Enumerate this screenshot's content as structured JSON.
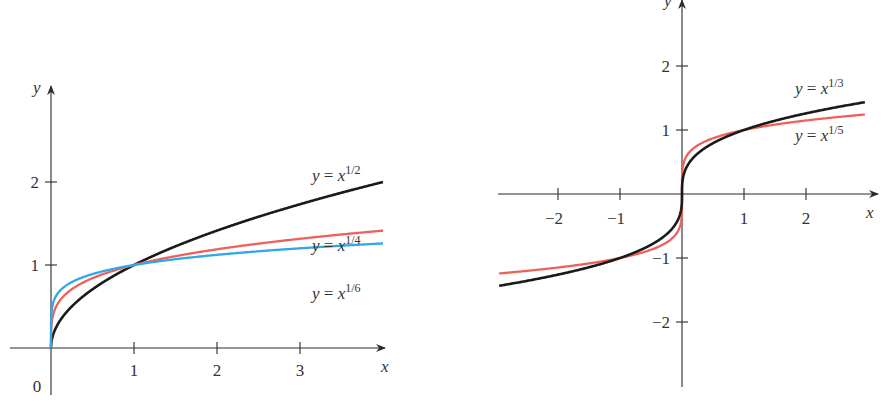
{
  "chart_data": [
    {
      "type": "line",
      "title": "",
      "xlabel": "x",
      "ylabel": "y",
      "xlim": [
        0,
        4
      ],
      "ylim": [
        0,
        2.6
      ],
      "origin_label": "0",
      "x_ticks": [
        "1",
        "2",
        "3"
      ],
      "y_ticks": [
        "1",
        "2"
      ],
      "grid": false,
      "series": [
        {
          "name": "y = x^(1/2)",
          "label_base": "y = x",
          "label_exp": "1/2",
          "exponent": 0.5,
          "color": "#1a1a1a",
          "x": [
            0,
            0.25,
            0.5,
            1,
            1.5,
            2,
            2.5,
            3,
            3.5,
            4
          ],
          "values": [
            0,
            0.5,
            0.71,
            1,
            1.22,
            1.41,
            1.58,
            1.73,
            1.87,
            2
          ]
        },
        {
          "name": "y = x^(1/4)",
          "label_base": "y = x",
          "label_exp": "1/4",
          "exponent": 0.25,
          "color": "#f0605a",
          "x": [
            0,
            0.25,
            0.5,
            1,
            1.5,
            2,
            2.5,
            3,
            3.5,
            4
          ],
          "values": [
            0,
            0.71,
            0.84,
            1,
            1.11,
            1.19,
            1.26,
            1.32,
            1.37,
            1.41
          ]
        },
        {
          "name": "y = x^(1/6)",
          "label_base": "y = x",
          "label_exp": "1/6",
          "exponent": 0.1667,
          "color": "#2fa8e8",
          "x": [
            0,
            0.25,
            0.5,
            1,
            1.5,
            2,
            2.5,
            3,
            3.5,
            4
          ],
          "values": [
            0,
            0.79,
            0.89,
            1,
            1.07,
            1.12,
            1.16,
            1.2,
            1.23,
            1.26
          ]
        }
      ]
    },
    {
      "type": "line",
      "title": "",
      "xlabel": "x",
      "ylabel": "y",
      "xlim": [
        -2.95,
        2.95
      ],
      "ylim": [
        -3,
        3
      ],
      "x_ticks": [
        "−2",
        "−1",
        "1",
        "2"
      ],
      "y_ticks": [
        "2",
        "1",
        "−1",
        "−2"
      ],
      "grid": false,
      "series": [
        {
          "name": "y = x^(1/3)",
          "label_base": "y = x",
          "label_exp": "1/3",
          "exponent": 0.3333,
          "color": "#1a1a1a",
          "x": [
            -2.95,
            -2,
            -1,
            -0.5,
            0,
            0.5,
            1,
            2,
            2.95
          ],
          "values": [
            -1.43,
            -1.26,
            -1,
            -0.79,
            0,
            0.79,
            1,
            1.26,
            1.43
          ]
        },
        {
          "name": "y = x^(1/5)",
          "label_base": "y = x",
          "label_exp": "1/5",
          "exponent": 0.2,
          "color": "#f0605a",
          "x": [
            -2.95,
            -2,
            -1,
            -0.5,
            0,
            0.5,
            1,
            2,
            2.95
          ],
          "values": [
            -1.24,
            -1.15,
            -1,
            -0.87,
            0,
            0.87,
            1,
            1.15,
            1.24
          ]
        }
      ]
    }
  ]
}
